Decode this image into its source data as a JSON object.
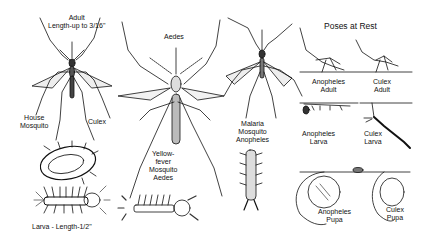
{
  "title": "Poses at Rest",
  "panels": {
    "culex": {
      "adult_label_line1": "Adult",
      "adult_label_line2": "Length-up to 3/16\"",
      "common_name_line1": "House",
      "common_name_line2": "Mosquito",
      "genus": "Culex",
      "larva_label": "Larva - Length-1/2\""
    },
    "aedes": {
      "genus_top": "Aedes",
      "caption_line1": "Yellow-",
      "caption_line2": "fever",
      "caption_line3": "Mosquito",
      "caption_line4": "Aedes"
    },
    "anopheles": {
      "caption_line1": "Malaria",
      "caption_line2": "Mosquito",
      "caption_line3": "Anopheles"
    },
    "poses_at_rest": {
      "heading": "Poses at Rest",
      "anopheles_adult_line1": "Anopheles",
      "anopheles_adult_line2": "Adult",
      "culex_adult_line1": "Culex",
      "culex_adult_line2": "Adult",
      "anopheles_larva_line1": "Anopheles",
      "anopheles_larva_line2": "Larva",
      "culex_larva_line1": "Culex",
      "culex_larva_line2": "Larva",
      "anopheles_pupa_line1": "Anopheles",
      "anopheles_pupa_line2": "Pupa",
      "culex_pupa_line1": "Culex",
      "culex_pupa_line2": "Pupa"
    }
  },
  "colors": {
    "ink": "#111111",
    "paper": "#ffffff",
    "shade": "#888888"
  }
}
